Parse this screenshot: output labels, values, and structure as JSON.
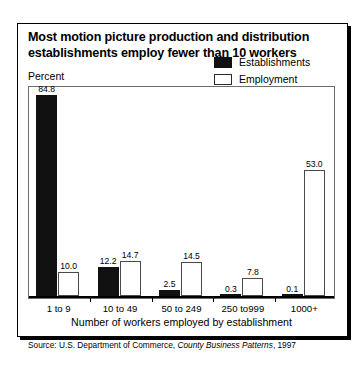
{
  "figure": {
    "title": "Most motion picture production and distribution establishments employ fewer than 10 workers",
    "yaxis_label": "Percent",
    "xaxis_title": "Number of workers employed by establishment",
    "source_prefix": "Source: U.S. Department of Commerce,",
    "source_italic": "County Business Patterns",
    "source_suffix": ", 1997"
  },
  "legend": {
    "items": [
      {
        "label": "Establishments",
        "swatch": "solid",
        "color": "#111111"
      },
      {
        "label": "Employment",
        "swatch": "hollow",
        "color": "#ffffff"
      }
    ]
  },
  "chart_data": {
    "type": "bar",
    "title": "Most motion picture production and distribution establishments employ fewer than 10 workers",
    "xlabel": "Number of workers employed by establishment",
    "ylabel": "Percent",
    "ylim": [
      0,
      90
    ],
    "grid": false,
    "legend_position": "top-right",
    "categories": [
      "1 to 9",
      "10 to 49",
      "50 to 249",
      "250 to999",
      "1000+"
    ],
    "series": [
      {
        "name": "Establishments",
        "values": [
          84.8,
          12.2,
          2.5,
          0.3,
          0.1
        ]
      },
      {
        "name": "Employment",
        "values": [
          10.0,
          14.7,
          14.5,
          7.8,
          53.0
        ]
      }
    ],
    "value_labels": {
      "Establishments": [
        "84.8",
        "12.2",
        "2.5",
        "0.3",
        "0.1"
      ],
      "Employment": [
        "10.0",
        "14.7",
        "14.5",
        "7.8",
        "53.0"
      ]
    },
    "source": "Source: U.S. Department of Commerce, County Business Patterns, 1997"
  }
}
